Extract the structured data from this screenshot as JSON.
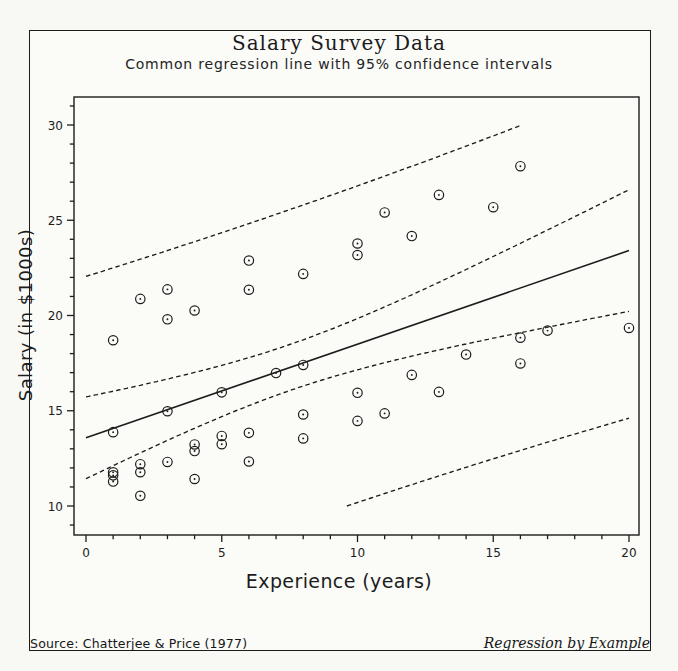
{
  "figure": {
    "source": "Source: Chatterjee & Price (1977)",
    "credit": "Regression by Example"
  },
  "chart_data": {
    "type": "scatter",
    "title": "Salary Survey Data",
    "subtitle": "Common regression line with 95% confidence intervals",
    "xlabel": "Experience (years)",
    "ylabel": "Salary (in $1000s)",
    "xlim": [
      -0.45,
      20.35
    ],
    "ylim": [
      8.45,
      31.5
    ],
    "x_ticks": [
      0,
      5,
      10,
      15,
      20
    ],
    "y_ticks": [
      10,
      15,
      20,
      25,
      30
    ],
    "minor_tick_step_x": 1,
    "minor_tick_step_y": 1,
    "grid": false,
    "marker": "circled-dot",
    "ink_color": "#1c1c1c",
    "points": [
      [
        1,
        13.876
      ],
      [
        1,
        11.608
      ],
      [
        1,
        18.701
      ],
      [
        1,
        11.283
      ],
      [
        1,
        11.767
      ],
      [
        2,
        20.872
      ],
      [
        2,
        11.772
      ],
      [
        2,
        10.535
      ],
      [
        2,
        12.195
      ],
      [
        3,
        12.313
      ],
      [
        3,
        14.975
      ],
      [
        3,
        21.371
      ],
      [
        3,
        19.8
      ],
      [
        4,
        11.417
      ],
      [
        4,
        20.263
      ],
      [
        4,
        13.231
      ],
      [
        4,
        12.884
      ],
      [
        5,
        13.245
      ],
      [
        5,
        13.677
      ],
      [
        5,
        15.965
      ],
      [
        6,
        12.336
      ],
      [
        6,
        21.352
      ],
      [
        6,
        13.839
      ],
      [
        6,
        22.884
      ],
      [
        7,
        16.978
      ],
      [
        8,
        14.803
      ],
      [
        8,
        17.404
      ],
      [
        8,
        22.184
      ],
      [
        8,
        13.548
      ],
      [
        10,
        14.467
      ],
      [
        10,
        15.942
      ],
      [
        10,
        23.174
      ],
      [
        10,
        23.78
      ],
      [
        11,
        25.41
      ],
      [
        11,
        14.861
      ],
      [
        12,
        16.882
      ],
      [
        12,
        24.17
      ],
      [
        13,
        15.99
      ],
      [
        13,
        26.33
      ],
      [
        14,
        17.949
      ],
      [
        15,
        25.685
      ],
      [
        16,
        27.837
      ],
      [
        16,
        18.838
      ],
      [
        16,
        17.483
      ],
      [
        17,
        19.207
      ],
      [
        20,
        19.346
      ]
    ],
    "regression": {
      "type": "linear",
      "intercept": 13.58,
      "slope": 0.4915,
      "x_range": [
        0,
        20
      ],
      "ci_level": 95,
      "n": 46,
      "x_mean": 7.5,
      "sxx": 1203.5,
      "t_times_s": 8.2,
      "band_clip_y": [
        10,
        30
      ],
      "bands": [
        "mean-confidence-upper",
        "mean-confidence-lower",
        "prediction-upper",
        "prediction-lower"
      ]
    }
  }
}
